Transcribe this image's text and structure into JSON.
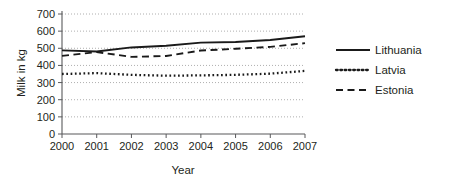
{
  "chart_data": {
    "type": "line",
    "title": "",
    "xlabel": "Year",
    "ylabel": "Milk in kg",
    "x": [
      2000,
      2001,
      2002,
      2003,
      2004,
      2005,
      2006,
      2007
    ],
    "categories": [
      "2000",
      "2001",
      "2002",
      "2003",
      "2004",
      "2005",
      "2006",
      "2007"
    ],
    "ylim": [
      0,
      700
    ],
    "yticks": [
      0,
      100,
      200,
      300,
      400,
      500,
      600,
      700
    ],
    "ytick_labels": [
      "0",
      "100",
      "200",
      "300",
      "400",
      "500",
      "600",
      "700"
    ],
    "grid": true,
    "legend_position": "right",
    "series": [
      {
        "name": "Lithuania",
        "style": "solid",
        "color": "#1a1a1a",
        "values": [
          488,
          481,
          505,
          515,
          533,
          537,
          548,
          570
        ]
      },
      {
        "name": "Latvia",
        "style": "dotted",
        "color": "#1a1a1a",
        "values": [
          350,
          355,
          345,
          340,
          342,
          345,
          352,
          368
        ]
      },
      {
        "name": "Estonia",
        "style": "dashed",
        "color": "#1a1a1a",
        "values": [
          456,
          478,
          450,
          455,
          487,
          497,
          508,
          530
        ]
      }
    ]
  },
  "axes": {
    "ylabel": "Milk in kg",
    "xlabel": "Year",
    "ytick_labels": [
      "700",
      "600",
      "500",
      "400",
      "300",
      "200",
      "100",
      "0"
    ],
    "xtick_labels": [
      "2000",
      "2001",
      "2002",
      "2003",
      "2004",
      "2005",
      "2006",
      "2007"
    ]
  },
  "legend": {
    "entries": [
      {
        "label": "Lithuania",
        "style": "solid"
      },
      {
        "label": "Latvia",
        "style": "dotted"
      },
      {
        "label": "Estonia",
        "style": "dashed"
      }
    ]
  }
}
